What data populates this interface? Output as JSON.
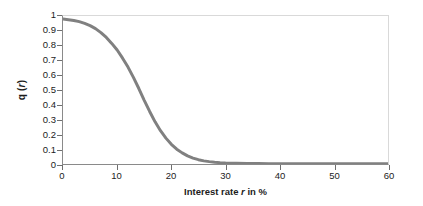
{
  "chart_data": {
    "type": "line",
    "title": "",
    "xlabel_parts": {
      "pre": "Interest rate ",
      "var": "r",
      "post": " in %"
    },
    "xlabel": "Interest rate r in %",
    "ylabel_parts": {
      "pre": "q (",
      "var": "r",
      "post": ")"
    },
    "ylabel": "q (r)",
    "xlim": [
      0,
      60
    ],
    "ylim": [
      0,
      1
    ],
    "grid": false,
    "legend": false,
    "legend_position": "none",
    "x_ticks": [
      0,
      10,
      20,
      30,
      40,
      50,
      60
    ],
    "x_tick_labels": [
      "0",
      "10",
      "20",
      "30",
      "40",
      "50",
      "60"
    ],
    "y_ticks": [
      0,
      0.1,
      0.2,
      0.3,
      0.4,
      0.5,
      0.6,
      0.7,
      0.8,
      0.9,
      1
    ],
    "y_tick_labels": [
      "0",
      "0.1",
      "0.2",
      "0.3",
      "0.4",
      "0.5",
      "0.6",
      "0.7",
      "0.8",
      "0.9",
      "1"
    ],
    "series": [
      {
        "name": "q(r)",
        "color": "#808080",
        "line_width": 3,
        "x": [
          0,
          1,
          2,
          3,
          4,
          5,
          6,
          7,
          8,
          9,
          10,
          11,
          12,
          13,
          14,
          15,
          16,
          17,
          18,
          19,
          20,
          21,
          22,
          23,
          24,
          25,
          26,
          27,
          28,
          29,
          30,
          32,
          34,
          36,
          38,
          40,
          45,
          50,
          55,
          60
        ],
        "values": [
          0.98,
          0.975,
          0.97,
          0.962,
          0.95,
          0.935,
          0.915,
          0.888,
          0.855,
          0.815,
          0.77,
          0.715,
          0.655,
          0.585,
          0.51,
          0.43,
          0.355,
          0.285,
          0.225,
          0.175,
          0.133,
          0.1,
          0.075,
          0.055,
          0.04,
          0.029,
          0.021,
          0.016,
          0.012,
          0.009,
          0.007,
          0.005,
          0.004,
          0.003,
          0.002,
          0.002,
          0.001,
          0.001,
          0.001,
          0.001
        ]
      }
    ],
    "colors": {
      "curve": "#808080",
      "axis": "#8a8a8a",
      "frame_light": "#d9d9d9",
      "tick": "#6f6f6f",
      "text": "#1c1c1c",
      "background": "#ffffff"
    }
  }
}
